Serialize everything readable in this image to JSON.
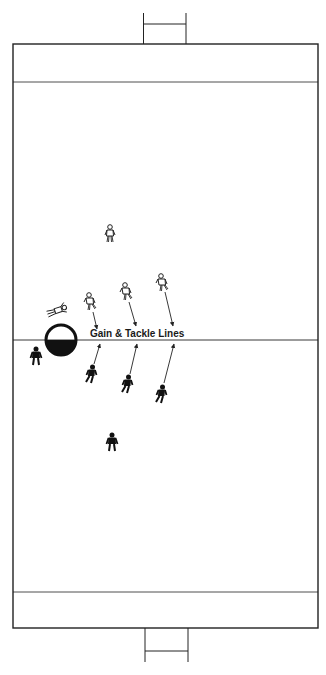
{
  "diagram": {
    "label": "Gain & Tackle Lines",
    "colors": {
      "lines": "#222222",
      "attacker_fill": "#ffffff",
      "defender_fill": "#111111",
      "background": "#ffffff"
    },
    "field": {
      "boundary": {
        "x1": 13,
        "y1": 44,
        "x2": 318,
        "y2": 628
      },
      "top_try_line_y": 82,
      "bottom_try_line_y": 592,
      "halfway_line_y": 340,
      "top_posts": {
        "left_x": 143,
        "right_x": 186,
        "top_y": 13,
        "crossbar_y": 24
      },
      "bottom_posts": {
        "left_x": 145,
        "right_x": 188,
        "bottom_y": 662,
        "crossbar_y": 651
      }
    },
    "ball": {
      "cx": 61,
      "cy": 340,
      "r": 16,
      "note": "Circle marker, top half white, bottom half black"
    },
    "attackers": [
      {
        "id": "a1",
        "x": 110,
        "y": 234,
        "style": "outline"
      },
      {
        "id": "a2",
        "x": 90,
        "y": 302,
        "style": "outline-running"
      },
      {
        "id": "a3",
        "x": 126,
        "y": 292,
        "style": "outline-running"
      },
      {
        "id": "a4",
        "x": 162,
        "y": 282,
        "style": "outline-running"
      },
      {
        "id": "a5-lying",
        "x": 57,
        "y": 310,
        "style": "outline-lying"
      }
    ],
    "defenders": [
      {
        "id": "d1",
        "x": 36,
        "y": 356,
        "style": "solid"
      },
      {
        "id": "d2",
        "x": 91,
        "y": 373,
        "style": "solid-running"
      },
      {
        "id": "d3",
        "x": 127,
        "y": 384,
        "style": "solid-running"
      },
      {
        "id": "d4",
        "x": 161,
        "y": 393,
        "style": "solid-running"
      },
      {
        "id": "d5",
        "x": 112,
        "y": 442,
        "style": "solid"
      }
    ],
    "arrows": [
      {
        "from": [
          93,
          312
        ],
        "to": [
          97,
          329
        ],
        "kind": "attacker-run"
      },
      {
        "from": [
          129,
          302
        ],
        "to": [
          136,
          326
        ],
        "kind": "attacker-run"
      },
      {
        "from": [
          165,
          292
        ],
        "to": [
          173,
          326
        ],
        "kind": "attacker-run"
      },
      {
        "from": [
          94,
          364
        ],
        "to": [
          100,
          344
        ],
        "kind": "defender-run"
      },
      {
        "from": [
          130,
          374
        ],
        "to": [
          137,
          344
        ],
        "kind": "defender-run"
      },
      {
        "from": [
          164,
          383
        ],
        "to": [
          174,
          344
        ],
        "kind": "defender-run"
      }
    ]
  }
}
